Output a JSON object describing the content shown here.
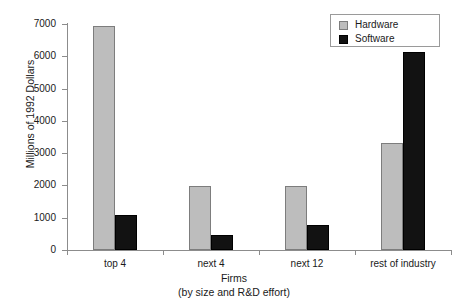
{
  "chart_data": {
    "type": "bar",
    "title": "",
    "xlabel": "Firms",
    "xlabel_sub": "(by size and R&D effort)",
    "ylabel": "Millions of 1992 Dollars",
    "categories": [
      "top 4",
      "next 4",
      "next 12",
      "rest of industry"
    ],
    "series": [
      {
        "name": "Hardware",
        "color": "#bdbdbd",
        "values": [
          6950,
          1980,
          1985,
          3330
        ]
      },
      {
        "name": "Software",
        "color": "#121212",
        "values": [
          1080,
          450,
          770,
          6130
        ]
      }
    ],
    "ylim": [
      0,
      7000
    ],
    "yticks": [
      0,
      1000,
      2000,
      3000,
      4000,
      5000,
      6000,
      7000
    ],
    "ytick_labels": [
      "0",
      "1000",
      "2000",
      "3000",
      "4000",
      "5000",
      "6000",
      "7000"
    ],
    "grid": false,
    "legend_position": "top-right",
    "legend_entries": [
      "Hardware",
      "Software"
    ]
  }
}
